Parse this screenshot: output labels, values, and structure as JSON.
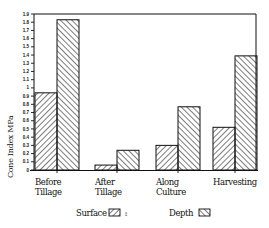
{
  "chart_data": {
    "type": "bar",
    "title": "",
    "xlabel": "",
    "ylabel": "Cone Index MPa",
    "ylim": [
      0,
      1.9
    ],
    "yticks": [
      0,
      0.1,
      0.2,
      0.3,
      0.4,
      0.5,
      0.6,
      0.7,
      0.8,
      0.9,
      1,
      1.1,
      1.2,
      1.3,
      1.4,
      1.5,
      1.6,
      1.7,
      1.8,
      1.9
    ],
    "ytick_labels": [
      "0",
      "0.1",
      "0.2",
      "0.3",
      "0.4",
      "0.5",
      "0.6",
      "0.7",
      "0.8",
      "0.9",
      "1",
      "1.1",
      "1.2",
      "1.3",
      "1.4",
      "1.5",
      "1.6",
      "1.7",
      "1.8",
      "1.9"
    ],
    "categories": [
      "Before Tillage",
      "After Tillage",
      "Along Culture",
      "Harvesting"
    ],
    "category_lines": [
      [
        "Before",
        "Tillage"
      ],
      [
        "After",
        "Tillage"
      ],
      [
        "Along",
        "Culture"
      ],
      [
        "Harvesting"
      ]
    ],
    "series": [
      {
        "name": "Surface",
        "pattern": "diagonal-forward",
        "values": [
          0.94,
          0.06,
          0.3,
          0.52
        ]
      },
      {
        "name": "Depth",
        "pattern": "diagonal-backward",
        "values": [
          1.83,
          0.24,
          0.77,
          1.39
        ]
      }
    ],
    "grid": false,
    "legend_position": "bottom"
  },
  "legend": {
    "surface_label": "Surface",
    "surface_marker_suffix": "↕",
    "depth_label": "Depth"
  },
  "colors": {
    "ink": "#111111",
    "background": "#ffffff"
  }
}
